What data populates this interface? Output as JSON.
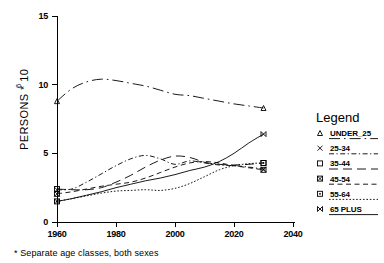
{
  "chart_data": {
    "type": "line",
    "title": "",
    "xlabel": "",
    "ylabel": "PERSONS * 10",
    "ylabel_exponent": "6",
    "xlim": [
      1955,
      2042
    ],
    "ylim": [
      0,
      15
    ],
    "x_ticks": [
      "1960",
      "1980",
      "2000",
      "2020",
      "2040"
    ],
    "x_tick_values": [
      1960,
      1980,
      2000,
      2020,
      2040
    ],
    "y_ticks": [
      "0",
      "5",
      "10",
      "15"
    ],
    "y_tick_values": [
      0,
      5,
      10,
      15
    ],
    "grid": false,
    "legend_position": "right",
    "footnote": "* Separate age classes, both sexes",
    "series": [
      {
        "name": "UNDER_25",
        "marker": "triangle",
        "line_style": "dashdot-long",
        "x": [
          1960,
          1965,
          1970,
          1975,
          1980,
          1985,
          1990,
          1995,
          2000,
          2005,
          2010,
          2015,
          2020,
          2025,
          2030
        ],
        "values": [
          8.8,
          9.7,
          10.2,
          10.4,
          10.3,
          10.1,
          9.9,
          9.6,
          9.3,
          9.2,
          9.0,
          8.8,
          8.6,
          8.45,
          8.3
        ]
      },
      {
        "name": "25-34",
        "marker": "cross",
        "line_style": "dashdot-short",
        "x": [
          1960,
          1965,
          1970,
          1975,
          1980,
          1985,
          1990,
          1995,
          2000,
          2005,
          2010,
          2015,
          2020,
          2025,
          2030
        ],
        "values": [
          2.35,
          2.4,
          2.9,
          3.5,
          4.1,
          4.6,
          4.85,
          4.6,
          4.2,
          4.45,
          4.3,
          4.15,
          4.1,
          4.0,
          3.85
        ]
      },
      {
        "name": "35-44",
        "marker": "square",
        "line_style": "longdash",
        "x": [
          1960,
          1965,
          1970,
          1975,
          1980,
          1985,
          1990,
          1995,
          2000,
          2005,
          2010,
          2015,
          2020,
          2025,
          2030
        ],
        "values": [
          2.4,
          2.35,
          2.35,
          2.5,
          2.9,
          3.4,
          4.0,
          4.5,
          4.8,
          4.7,
          4.35,
          4.2,
          4.15,
          4.2,
          4.3
        ]
      },
      {
        "name": "45-54",
        "marker": "square-crossed",
        "line_style": "medium-dash",
        "x": [
          1960,
          1965,
          1970,
          1975,
          1980,
          1985,
          1990,
          1995,
          2000,
          2005,
          2010,
          2015,
          2020,
          2025,
          2030
        ],
        "values": [
          2.05,
          2.2,
          2.4,
          2.6,
          2.75,
          2.9,
          3.2,
          3.6,
          4.0,
          4.3,
          4.4,
          4.3,
          4.1,
          3.95,
          3.8
        ]
      },
      {
        "name": "55-64",
        "marker": "square-dotted",
        "line_style": "dotted",
        "x": [
          1960,
          1965,
          1970,
          1975,
          1980,
          1985,
          1990,
          1995,
          2000,
          2005,
          2010,
          2015,
          2020,
          2025,
          2030
        ],
        "values": [
          1.5,
          1.7,
          1.9,
          2.1,
          2.25,
          2.3,
          2.35,
          2.3,
          2.45,
          2.8,
          3.3,
          3.8,
          4.1,
          4.25,
          4.3
        ]
      },
      {
        "name": "65 PLUS",
        "marker": "bowtie",
        "line_style": "solid",
        "x": [
          1960,
          1965,
          1970,
          1975,
          1980,
          1985,
          1990,
          1995,
          2000,
          2005,
          2010,
          2015,
          2020,
          2025,
          2030
        ],
        "values": [
          1.5,
          1.7,
          1.95,
          2.2,
          2.5,
          2.75,
          3.0,
          3.2,
          3.45,
          3.75,
          4.0,
          4.4,
          5.0,
          5.75,
          6.4
        ]
      }
    ]
  },
  "legend": {
    "title": "Legend",
    "items": [
      {
        "label": "UNDER_25",
        "marker": "triangle-marker",
        "series_index": 0
      },
      {
        "label": "25-34",
        "marker": "cross-marker",
        "series_index": 1
      },
      {
        "label": "35-44",
        "marker": "square-marker",
        "series_index": 2
      },
      {
        "label": "45-54",
        "marker": "square-crossed-marker",
        "series_index": 3
      },
      {
        "label": "55-64",
        "marker": "square-dotted-marker",
        "series_index": 4
      },
      {
        "label": "65 PLUS",
        "marker": "bowtie-marker",
        "series_index": 5
      }
    ]
  },
  "colors": {
    "foreground": "#000000",
    "background": "#ffffff"
  }
}
